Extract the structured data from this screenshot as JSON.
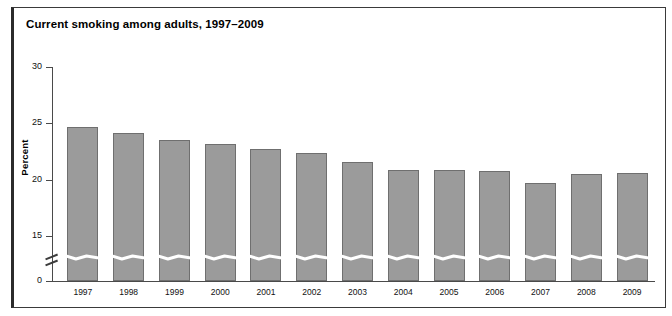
{
  "figure": {
    "title": "Current smoking among adults, 1997–2009",
    "frame_color": "#2b2b2b",
    "background": "#ffffff"
  },
  "chart_data": {
    "type": "bar",
    "title": "Current smoking among adults, 1997–2009",
    "xlabel": "",
    "ylabel": "Percent",
    "categories": [
      "1997",
      "1998",
      "1999",
      "2000",
      "2001",
      "2002",
      "2003",
      "2004",
      "2005",
      "2006",
      "2007",
      "2008",
      "2009"
    ],
    "values": [
      24.7,
      24.1,
      23.5,
      23.2,
      22.7,
      22.4,
      21.6,
      20.9,
      20.9,
      20.8,
      19.7,
      20.5,
      20.6
    ],
    "ylim": [
      0,
      30
    ],
    "yticks": [
      0,
      15,
      20,
      25,
      30
    ],
    "ytick_labels": [
      "0",
      "15",
      "20",
      "25",
      "30"
    ],
    "axis_break": {
      "present": true,
      "between": [
        0,
        15
      ],
      "note": "y-axis is broken between 0 and 15; each bar is crossed by a white wavy break line"
    },
    "grid": false,
    "legend": null,
    "bar_color": "#9b9b9b",
    "bar_edge_color": "#6f6f6f",
    "series": [
      {
        "name": "Percent of adults who currently smoke",
        "values": [
          24.7,
          24.1,
          23.5,
          23.2,
          22.7,
          22.4,
          21.6,
          20.9,
          20.9,
          20.8,
          19.7,
          20.5,
          20.6
        ]
      }
    ]
  }
}
